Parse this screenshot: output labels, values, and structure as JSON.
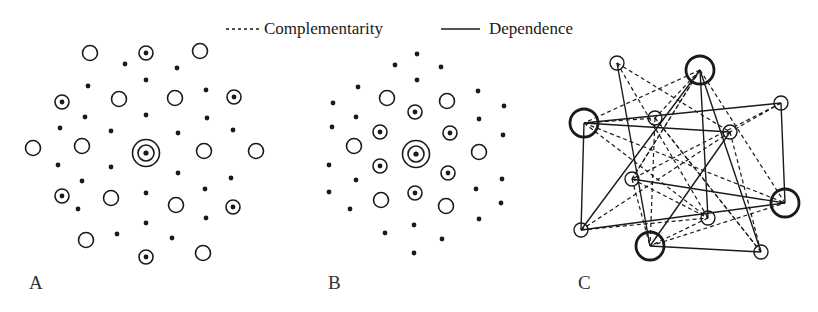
{
  "legend": {
    "complementarity_label": "Complementarity",
    "dependence_label": "Dependence"
  },
  "panels": {
    "A": {
      "label": "A",
      "center": [
        146,
        153
      ],
      "open_circles": [
        [
          90,
          53
        ],
        [
          200,
          51
        ],
        [
          33,
          148
        ],
        [
          82,
          146
        ],
        [
          119,
          99
        ],
        [
          175,
          98
        ],
        [
          204,
          151
        ],
        [
          256,
          151
        ],
        [
          111,
          198
        ],
        [
          176,
          205
        ],
        [
          86,
          240
        ],
        [
          203,
          253
        ]
      ],
      "dotted_circles": [
        [
          146,
          53
        ],
        [
          62,
          102
        ],
        [
          234,
          97
        ],
        [
          62,
          196
        ],
        [
          233,
          207
        ],
        [
          146,
          257
        ]
      ],
      "dots": [
        [
          125,
          64
        ],
        [
          177,
          68
        ],
        [
          146,
          80
        ],
        [
          88,
          86
        ],
        [
          206,
          90
        ],
        [
          85,
          117
        ],
        [
          146,
          115
        ],
        [
          207,
          118
        ],
        [
          60,
          128
        ],
        [
          111,
          131
        ],
        [
          178,
          133
        ],
        [
          233,
          130
        ],
        [
          58,
          165
        ],
        [
          111,
          167
        ],
        [
          178,
          173
        ],
        [
          231,
          178
        ],
        [
          82,
          181
        ],
        [
          146,
          193
        ],
        [
          205,
          189
        ],
        [
          78,
          209
        ],
        [
          206,
          218
        ],
        [
          146,
          223
        ],
        [
          117,
          234
        ],
        [
          172,
          238
        ]
      ]
    },
    "B": {
      "label": "B",
      "center": [
        416,
        154
      ],
      "open_circles": [
        [
          387,
          98
        ],
        [
          447,
          101
        ],
        [
          354,
          146
        ],
        [
          479,
          152
        ],
        [
          381,
          200
        ],
        [
          446,
          206
        ]
      ],
      "dotted_circles": [
        [
          415,
          112
        ],
        [
          380,
          132
        ],
        [
          450,
          133
        ],
        [
          380,
          166
        ],
        [
          448,
          173
        ],
        [
          415,
          193
        ]
      ],
      "dots": [
        [
          417,
          54
        ],
        [
          395,
          65
        ],
        [
          441,
          67
        ],
        [
          417,
          80
        ],
        [
          358,
          87
        ],
        [
          478,
          91
        ],
        [
          333,
          103
        ],
        [
          504,
          106
        ],
        [
          356,
          117
        ],
        [
          479,
          119
        ],
        [
          332,
          127
        ],
        [
          503,
          135
        ],
        [
          329,
          165
        ],
        [
          356,
          180
        ],
        [
          502,
          179
        ],
        [
          329,
          192
        ],
        [
          476,
          189
        ],
        [
          501,
          203
        ],
        [
          350,
          209
        ],
        [
          479,
          219
        ],
        [
          385,
          233
        ],
        [
          414,
          225
        ],
        [
          442,
          239
        ],
        [
          414,
          253
        ]
      ]
    },
    "C": {
      "label": "C",
      "nodes": [
        {
          "id": 1,
          "x": 617,
          "y": 63,
          "big": false
        },
        {
          "id": 2,
          "x": 700,
          "y": 70,
          "big": true
        },
        {
          "id": 3,
          "x": 584,
          "y": 123,
          "big": true
        },
        {
          "id": 4,
          "x": 655,
          "y": 118,
          "big": false
        },
        {
          "id": 5,
          "x": 781,
          "y": 103,
          "big": false
        },
        {
          "id": 6,
          "x": 730,
          "y": 132,
          "big": false
        },
        {
          "id": 7,
          "x": 632,
          "y": 179,
          "big": false
        },
        {
          "id": 8,
          "x": 785,
          "y": 203,
          "big": true
        },
        {
          "id": 9,
          "x": 708,
          "y": 218,
          "big": false
        },
        {
          "id": 10,
          "x": 581,
          "y": 230,
          "big": false
        },
        {
          "id": 11,
          "x": 650,
          "y": 246,
          "big": true
        },
        {
          "id": 12,
          "x": 761,
          "y": 252,
          "big": false
        }
      ],
      "dependence_edges": [
        [
          1,
          11
        ],
        [
          2,
          10
        ],
        [
          2,
          9
        ],
        [
          2,
          12
        ],
        [
          3,
          5
        ],
        [
          3,
          6
        ],
        [
          3,
          10
        ],
        [
          5,
          8
        ],
        [
          6,
          11
        ],
        [
          7,
          8
        ],
        [
          10,
          8
        ],
        [
          11,
          12
        ]
      ],
      "complementarity_edges": [
        [
          1,
          6
        ],
        [
          1,
          9
        ],
        [
          2,
          3
        ],
        [
          2,
          4
        ],
        [
          2,
          7
        ],
        [
          2,
          8
        ],
        [
          3,
          4
        ],
        [
          3,
          8
        ],
        [
          3,
          9
        ],
        [
          4,
          11
        ],
        [
          4,
          12
        ],
        [
          5,
          6
        ],
        [
          5,
          7
        ],
        [
          6,
          10
        ],
        [
          6,
          12
        ],
        [
          7,
          9
        ],
        [
          7,
          11
        ],
        [
          7,
          2
        ],
        [
          9,
          11
        ],
        [
          10,
          9
        ],
        [
          11,
          8
        ],
        [
          12,
          4
        ]
      ]
    }
  }
}
